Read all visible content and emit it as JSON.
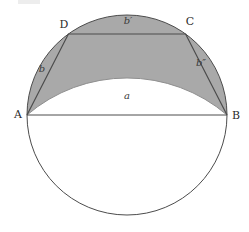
{
  "figure": {
    "vertex_labels": {
      "A": "A",
      "B": "B",
      "C": "C",
      "D": "D"
    },
    "side_labels": {
      "a": "a",
      "b": "b",
      "b_prime": "b′",
      "b_double_prime": "b″"
    },
    "colors": {
      "shaded_region": "#a9a9a9",
      "line": "#4c4c4c",
      "inner_arc_edge": "#8f8f8f",
      "background": "#ffffff",
      "artifact": "#e9e9e9"
    }
  }
}
